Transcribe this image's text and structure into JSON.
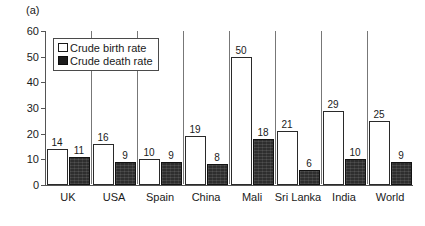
{
  "panel": {
    "caption": "(a)"
  },
  "legend": {
    "position": "top-left-inside",
    "items": [
      {
        "key": "birth",
        "label": "Crude birth rate",
        "swatch": "white-square-outline",
        "color": "#ffffff"
      },
      {
        "key": "death",
        "label": "Crude death rate",
        "swatch": "black-square",
        "color": "#1c1c1c"
      }
    ]
  },
  "axes": {
    "y_ticks": [
      0,
      10,
      20,
      30,
      40,
      50,
      60
    ],
    "y_tick_labels": [
      "0",
      "10",
      "20",
      "30",
      "40",
      "50",
      "60"
    ]
  },
  "chart_data": {
    "type": "bar",
    "title": "",
    "subtitle": "",
    "xlabel": "",
    "ylabel": "",
    "ylim": [
      0,
      60
    ],
    "ytick_step": 10,
    "grid": false,
    "legend_position": "upper left",
    "categories": [
      "UK",
      "USA",
      "Spain",
      "China",
      "Mali",
      "Sri Lanka",
      "India",
      "World"
    ],
    "series": [
      {
        "name": "Crude birth rate",
        "color": "#ffffff",
        "values": [
          14,
          16,
          10,
          19,
          50,
          21,
          29,
          25
        ],
        "data_labels": [
          "14",
          "16",
          "10",
          "19",
          "50",
          "21",
          "29",
          "25"
        ]
      },
      {
        "name": "Crude death rate",
        "color": "#1c1c1c",
        "values": [
          11,
          9,
          9,
          8,
          18,
          6,
          10,
          9
        ],
        "data_labels": [
          "11",
          "9",
          "9",
          "8",
          "18",
          "6",
          "10",
          "9"
        ]
      }
    ]
  }
}
